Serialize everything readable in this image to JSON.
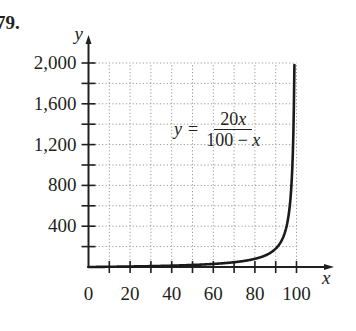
{
  "problem_number": "79.",
  "equation": {
    "lhs": "y",
    "equals": "=",
    "numerator_coef": "20",
    "numerator_var": "x",
    "denominator_const": "100 − ",
    "denominator_var": "x"
  },
  "chart_data": {
    "type": "line",
    "title": "",
    "function": "y = 20x / (100 - x)",
    "xlabel": "x",
    "ylabel": "y",
    "xlim": [
      0,
      100
    ],
    "ylim": [
      0,
      2000
    ],
    "grid": true,
    "legend": null,
    "x_ticks_major": [
      0,
      20,
      40,
      60,
      80,
      100
    ],
    "x_ticks_minor": [
      10,
      30,
      50,
      70,
      90
    ],
    "x_tick_labels": [
      "0",
      "20",
      "40",
      "60",
      "80",
      "100"
    ],
    "y_ticks_major": [
      400,
      800,
      1200,
      1600,
      2000
    ],
    "y_ticks_minor": [
      200,
      600,
      1000,
      1400,
      1800
    ],
    "y_tick_labels": [
      "400",
      "800",
      "1,200",
      "1,600",
      "2,000"
    ],
    "series": [
      {
        "name": "y = 20x/(100 - x)",
        "x": [
          0,
          10,
          20,
          30,
          40,
          50,
          60,
          70,
          80,
          85,
          90,
          92,
          94,
          95,
          96,
          97,
          98,
          98.5,
          99
        ],
        "y": [
          0,
          2.22,
          5,
          8.57,
          13.33,
          20,
          30,
          46.67,
          80,
          113.33,
          180,
          230,
          313.33,
          380,
          480,
          646.67,
          980,
          1313.33,
          1980
        ]
      }
    ],
    "annotations": [
      "y = 20x / (100 - x)"
    ]
  }
}
